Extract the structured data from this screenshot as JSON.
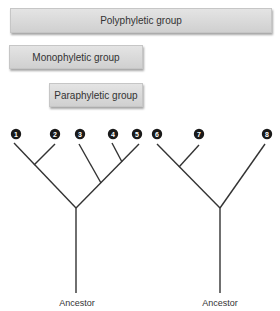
{
  "groups": [
    {
      "label": "Polyphyletic group"
    },
    {
      "label": "Monophyletic group"
    },
    {
      "label": "Paraphyletic group"
    }
  ],
  "trees": [
    {
      "ancestor_label": "Ancestor",
      "taxa": [
        "1",
        "2",
        "3",
        "4",
        "5"
      ]
    },
    {
      "ancestor_label": "Ancestor",
      "taxa": [
        "6",
        "7",
        "8"
      ]
    }
  ],
  "colors": {
    "line": "#333333",
    "node": "#1a1a1a",
    "bar": "#d9d9d9"
  }
}
